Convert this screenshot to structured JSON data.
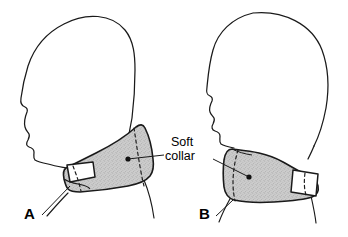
{
  "figure": {
    "type": "medical-line-illustration",
    "background_color": "#ffffff",
    "line_color": "#1a1a1a",
    "collar_fill_color": "#c9c9c9",
    "collar_stipple_color": "#8a8a8a",
    "text_color": "#000000"
  },
  "callout": {
    "line_1": "Soft",
    "line_2": "collar",
    "leader_left_target": "collar on figure A",
    "leader_right_target": "collar on figure B"
  },
  "panels": [
    {
      "id": "a",
      "letter": "A",
      "description": "Left lateral view of head and neck, face toward left, wearing soft cervical collar; collar shown as shaded wedge widening toward the back of the neck with fastening tab at the front",
      "facing": "left",
      "collar": {
        "fill": "#c9c9c9",
        "has_dashed_seam": true,
        "has_fastening_tab": true,
        "tab_position": "front-lower-left",
        "leader_dot": true
      }
    },
    {
      "id": "b",
      "letter": "B",
      "description": "Left lateral view of upright head and neck, face toward left, wearing soft cervical collar; collar shown as shaded band with fastening tab at the posterior right side",
      "facing": "left",
      "collar": {
        "fill": "#c9c9c9",
        "has_dashed_seam": true,
        "has_fastening_tab": true,
        "tab_position": "posterior-right",
        "leader_dot": true
      }
    }
  ]
}
